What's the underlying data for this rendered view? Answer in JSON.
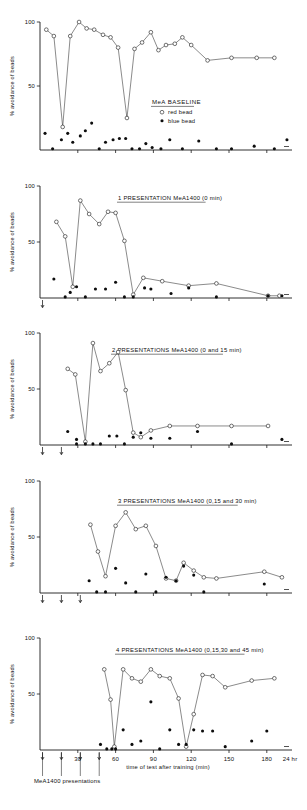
{
  "figure": {
    "y_axis_label": "% avoidance of beads",
    "y_ticks": [
      "100",
      "50"
    ],
    "x_ticks": [
      "30",
      "60",
      "90",
      "120",
      "150",
      "180",
      "24 hr"
    ],
    "x_axis_label": "time of test after training (min)",
    "presentation_note": "MeA1400 presentations",
    "marker_open_name": "red bead",
    "marker_closed_name": "blue bead"
  },
  "legend": {
    "title": "MeA BASELINE",
    "items": [
      {
        "symbol": "open-circle",
        "label": "red bead"
      },
      {
        "symbol": "filled-circle",
        "label": "blue bead"
      }
    ]
  },
  "panels": [
    {
      "id": "panel-baseline",
      "title": "MeA BASELINE",
      "title_in_plot": false,
      "presentation_arrows": [],
      "chart_data": {
        "type": "line",
        "title": "MeA BASELINE",
        "xlabel": "time of test after training (min)",
        "ylabel": "% avoidance of beads",
        "xlim": [
          0,
          200
        ],
        "ylim": [
          0,
          100
        ],
        "grid": false,
        "legend_position": "center-right",
        "series": [
          {
            "name": "red bead",
            "marker": "open-circle",
            "connected": true,
            "x": [
              5,
              11,
              18,
              24,
              31,
              37,
              43,
              50,
              56,
              62,
              69,
              75,
              81,
              88,
              94,
              100,
              107,
              113,
              120,
              133,
              152,
              172,
              186
            ],
            "y": [
              94,
              89,
              18,
              89,
              100,
              95,
              94,
              90,
              88,
              80,
              25,
              79,
              84,
              92,
              78,
              82,
              83,
              88,
              82,
              70,
              72,
              72,
              72
            ]
          },
          {
            "name": "blue bead",
            "marker": "filled-circle",
            "connected": false,
            "x": [
              4,
              10,
              17,
              22,
              26,
              32,
              36,
              41,
              47,
              52,
              58,
              63,
              68,
              73,
              79,
              84,
              89,
              96,
              103,
              113,
              126,
              140,
              152,
              170,
              186,
              196
            ],
            "y": [
              13,
              1,
              8,
              13,
              6,
              11,
              15,
              21,
              1,
              6,
              8,
              9,
              9,
              1,
              1,
              5,
              2,
              1,
              8,
              1,
              7,
              1,
              1,
              3,
              1,
              8
            ]
          }
        ]
      }
    },
    {
      "id": "panel-1-presentation",
      "title": "1 PRESENTATION MeA1400 (0 min)",
      "title_in_plot": true,
      "presentation_arrows": [
        0
      ],
      "chart_data": {
        "type": "line",
        "title": "1 PRESENTATION MeA1400 (0 min)",
        "xlabel": "time of test after training (min)",
        "ylabel": "% avoidance of beads",
        "xlim": [
          0,
          200
        ],
        "ylim": [
          0,
          100
        ],
        "grid": false,
        "series": [
          {
            "name": "red bead",
            "marker": "open-circle",
            "connected": true,
            "x": [
              13,
              20,
              26,
              32,
              39,
              47,
              54,
              60,
              67,
              74,
              82,
              97,
              118,
              140,
              181,
              190
            ],
            "y": [
              68,
              55,
              10,
              87,
              75,
              66,
              77,
              76,
              51,
              3,
              18,
              15,
              11,
              13,
              2,
              2
            ]
          },
          {
            "name": "blue bead",
            "marker": "filled-circle",
            "connected": false,
            "x": [
              11,
              20,
              24,
              29,
              36,
              44,
              52,
              60,
              67,
              74,
              83,
              88,
              104,
              118,
              140,
              181,
              192
            ],
            "y": [
              17,
              1,
              5,
              10,
              1,
              8,
              8,
              14,
              1,
              1,
              9,
              8,
              4,
              9,
              1,
              2,
              2
            ]
          }
        ]
      }
    },
    {
      "id": "panel-2-presentations",
      "title": "2 PRESENTATIONS MeA1400 (0 and 15 min)",
      "title_in_plot": true,
      "presentation_arrows": [
        0,
        15
      ],
      "chart_data": {
        "type": "line",
        "title": "2 PRESENTATIONS MeA1400 (0 and 15 min)",
        "xlabel": "time of test after training (min)",
        "ylabel": "% avoidance of beads",
        "xlim": [
          0,
          200
        ],
        "ylim": [
          0,
          100
        ],
        "grid": false,
        "series": [
          {
            "name": "red bead",
            "marker": "open-circle",
            "connected": true,
            "x": [
              22,
              28,
              36,
              42,
              48,
              55,
              62,
              68,
              74,
              80,
              88,
              103,
              125,
              152,
              181
            ],
            "y": [
              68,
              63,
              3,
              91,
              66,
              73,
              83,
              49,
              11,
              7,
              13,
              17,
              17,
              17,
              17
            ]
          },
          {
            "name": "blue bead",
            "marker": "filled-circle",
            "connected": false,
            "x": [
              22,
              29,
              29,
              36,
              42,
              48,
              55,
              61,
              67,
              74,
              80,
              88,
              103,
              125,
              152,
              192
            ],
            "y": [
              12,
              5,
              1,
              1,
              1,
              1,
              8,
              8,
              1,
              7,
              11,
              6,
              6,
              12,
              1,
              5
            ]
          }
        ]
      }
    },
    {
      "id": "panel-3-presentations",
      "title": "3 PRESENTATIONS MeA1400 (0,15 and 30 min)",
      "title_in_plot": true,
      "presentation_arrows": [
        0,
        15,
        30
      ],
      "chart_data": {
        "type": "line",
        "title": "3 PRESENTATIONS MeA1400 (0,15 and 30 min)",
        "xlabel": "time of test after training (min)",
        "ylabel": "% avoidance of beads",
        "xlim": [
          0,
          200
        ],
        "ylim": [
          0,
          100
        ],
        "grid": false,
        "series": [
          {
            "name": "red bead",
            "marker": "open-circle",
            "connected": true,
            "x": [
              40,
              46,
              52,
              60,
              68,
              76,
              84,
              92,
              100,
              108,
              114,
              122,
              130,
              140,
              178,
              192
            ],
            "y": [
              61,
              37,
              15,
              60,
              72,
              57,
              60,
              42,
              13,
              11,
              27,
              20,
              14,
              13,
              19,
              14
            ]
          },
          {
            "name": "blue bead",
            "marker": "filled-circle",
            "connected": false,
            "x": [
              39,
              45,
              52,
              60,
              68,
              76,
              84,
              92,
              100,
              108,
              114,
              122,
              130,
              178
            ],
            "y": [
              11,
              1,
              1,
              22,
              9,
              1,
              17,
              1,
              14,
              11,
              24,
              16,
              1,
              8
            ]
          }
        ]
      }
    },
    {
      "id": "panel-4-presentations",
      "title": "4 PRESENTATIONS MeA1400 (0,15,30 and 45 min)",
      "title_in_plot": true,
      "presentation_arrows": [
        0,
        15,
        30,
        45
      ],
      "chart_data": {
        "type": "line",
        "title": "4 PRESENTATIONS MeA1400 (0,15,30 and 45 min)",
        "xlabel": "time of test after training (min)",
        "ylabel": "% avoidance of beads",
        "xlim": [
          0,
          200
        ],
        "ylim": [
          0,
          100
        ],
        "grid": false,
        "series": [
          {
            "name": "red bead",
            "marker": "open-circle",
            "connected": true,
            "x": [
              51,
              56,
              59,
              66,
              73,
              80,
              88,
              95,
              103,
              110,
              116,
              122,
              129,
              137,
              147,
              168,
              186
            ],
            "y": [
              72,
              45,
              3,
              72,
              64,
              61,
              72,
              66,
              64,
              46,
              3,
              32,
              67,
              66,
              56,
              62,
              64,
              65
            ]
          },
          {
            "name": "blue bead",
            "marker": "filled-circle",
            "connected": false,
            "x": [
              48,
              53,
              57,
              60,
              66,
              73,
              80,
              88,
              95,
              103,
              110,
              116,
              122,
              129,
              137,
              147,
              168,
              180
            ],
            "y": [
              5,
              1,
              1,
              1,
              18,
              5,
              8,
              43,
              1,
              18,
              5,
              5,
              18,
              17,
              17,
              3,
              8,
              17
            ]
          }
        ]
      }
    }
  ]
}
